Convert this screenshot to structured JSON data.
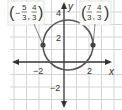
{
  "graph": {
    "x_axis_label": "x",
    "y_axis_label": "y",
    "x_ticks": [
      {
        "value": -2,
        "label": "−2"
      },
      {
        "value": 2,
        "label": "2"
      }
    ],
    "y_ticks": [
      {
        "value": 4,
        "label": "4"
      },
      {
        "value": 2,
        "label": "2"
      },
      {
        "value": -2,
        "label": "−2"
      }
    ],
    "grid_unit_px": 12.5,
    "origin_px": {
      "x": 64,
      "y": 62
    },
    "colors": {
      "grid": "#d4d4d4",
      "axis": "#333333",
      "circle": "#555555",
      "point": "#444444",
      "label_box": "#dddddd"
    }
  },
  "circle": {
    "center": {
      "x": 0.333,
      "y": 1.333
    },
    "radius": 2
  },
  "points": [
    {
      "name": "left-point",
      "x": -1.667,
      "y": 1.333,
      "label_x_num": "5",
      "label_x_den": "3",
      "label_x_sign": "−",
      "label_y_num": "4",
      "label_y_den": "3"
    },
    {
      "name": "right-point",
      "x": 2.333,
      "y": 1.333,
      "label_x_num": "7",
      "label_x_den": "3",
      "label_x_sign": "",
      "label_y_num": "4",
      "label_y_den": "3"
    }
  ]
}
